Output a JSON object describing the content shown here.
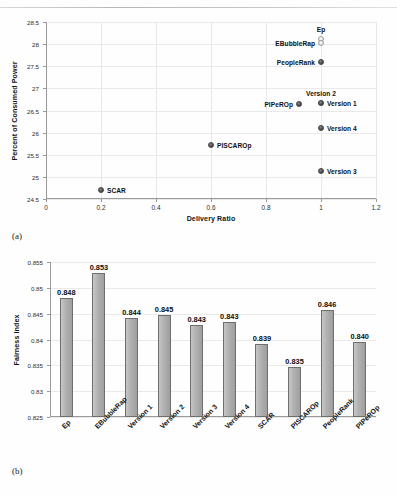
{
  "figure": {
    "caption_a": "(a)",
    "caption_b": "(b)"
  },
  "chart_data": [
    {
      "type": "scatter",
      "panel": "(a)",
      "title": "",
      "xlabel": "Delivery Ratio",
      "ylabel": "Percent of Consumed Power",
      "xlim": [
        0,
        1.2
      ],
      "ylim": [
        24.5,
        28.5
      ],
      "xticks": [
        "0",
        "0.2",
        "0.4",
        "0.6",
        "0.8",
        "1",
        "1.2"
      ],
      "xtick_values": [
        0,
        0.2,
        0.4,
        0.6,
        0.8,
        1,
        1.2
      ],
      "yticks": [
        "24.5",
        "25",
        "25.5",
        "26",
        "26.5",
        "27",
        "27.5",
        "28",
        "28.5"
      ],
      "ytick_values": [
        24.5,
        25,
        25.5,
        26,
        26.5,
        27,
        27.5,
        28,
        28.5
      ],
      "grid": "both",
      "legend": "none",
      "points": [
        {
          "label": "Ep",
          "x": 1.0,
          "y": 28.12,
          "label_pos": "above",
          "marker": "pale"
        },
        {
          "label": "EBubbleRap",
          "x": 1.0,
          "y": 28.02,
          "label_pos": "left",
          "marker": "pale"
        },
        {
          "label": "PeopleRank",
          "x": 1.0,
          "y": 27.6,
          "label_pos": "left",
          "marker": "dark"
        },
        {
          "label": "Version 2",
          "x": 1.0,
          "y": 26.68,
          "label_pos": "above",
          "marker": "pale"
        },
        {
          "label": "Version 1",
          "x": 1.0,
          "y": 26.67,
          "label_pos": "right",
          "marker": "dark"
        },
        {
          "label": "PIPeROp",
          "x": 0.92,
          "y": 26.64,
          "label_pos": "left",
          "marker": "dark"
        },
        {
          "label": "Version 4",
          "x": 1.0,
          "y": 26.1,
          "label_pos": "right",
          "marker": "dark"
        },
        {
          "label": "PISCAROp",
          "x": 0.6,
          "y": 25.73,
          "label_pos": "right",
          "marker": "dark"
        },
        {
          "label": "Version 3",
          "x": 1.0,
          "y": 25.14,
          "label_pos": "right",
          "marker": "dark"
        },
        {
          "label": "SCAR",
          "x": 0.2,
          "y": 24.7,
          "label_pos": "right",
          "marker": "dark"
        }
      ]
    },
    {
      "type": "bar",
      "panel": "(b)",
      "title": "",
      "xlabel": "",
      "ylabel": "Fairness Index",
      "ylim": [
        0.825,
        0.855
      ],
      "yticks": [
        "0.825",
        "0.83",
        "0.835",
        "0.84",
        "0.845",
        "0.85",
        "0.855"
      ],
      "ytick_values": [
        0.825,
        0.83,
        0.835,
        0.84,
        0.845,
        0.85,
        0.855
      ],
      "grid": "horizontal",
      "legend": "none",
      "categories": [
        "Ep",
        "EBubbleRap",
        "Version 1",
        "Version 2",
        "Version 3",
        "Version 4",
        "SCAR",
        "PISCAROp",
        "PeopleRank",
        "PIPeROp"
      ],
      "values": [
        0.848,
        0.853,
        0.844,
        0.845,
        0.843,
        0.843,
        0.839,
        0.835,
        0.846,
        0.84
      ],
      "value_labels": [
        "0.848",
        "0.853",
        "0.844",
        "0.845",
        "0.843",
        "0.843",
        "0.839",
        "0.835",
        "0.846",
        "0.840"
      ],
      "bar_exact": [
        0.848,
        0.8528,
        0.8441,
        0.8447,
        0.8428,
        0.8434,
        0.8391,
        0.8347,
        0.8457,
        0.8396
      ]
    }
  ]
}
